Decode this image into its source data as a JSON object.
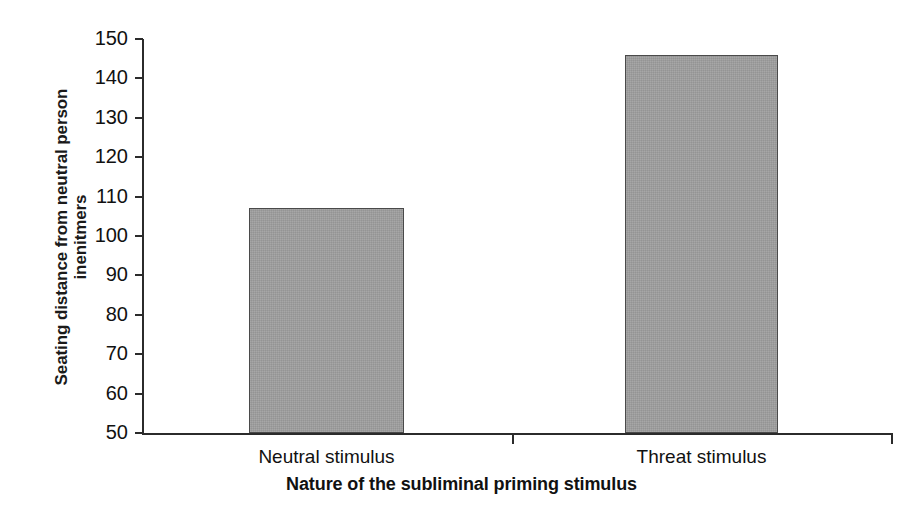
{
  "chart_data": {
    "type": "bar",
    "title": "",
    "subtitle": "",
    "xlabel": "Nature of the subliminal priming stimulus",
    "ylabel_lines": [
      "Seating distance from neutral person",
      "inenitmers"
    ],
    "ylabel": "Seating distance from neutral person inenitmers",
    "categories": [
      "Neutral stimulus",
      "Threat stimulus"
    ],
    "values": [
      107,
      146
    ],
    "ylim": [
      50,
      150
    ],
    "yticks": [
      50,
      60,
      70,
      80,
      90,
      100,
      110,
      120,
      130,
      140,
      150
    ],
    "ytick_labels": [
      "50",
      "60",
      "70",
      "80",
      "90",
      "100",
      "110",
      "120",
      "130",
      "140",
      "150"
    ],
    "grid": false,
    "legend": null,
    "legend_position": "none",
    "bar_color": "#9e9e9e",
    "bar_edge_color": "#4a4a4a",
    "axis_color": "#2b2b2b",
    "background_color": "#ffffff"
  }
}
